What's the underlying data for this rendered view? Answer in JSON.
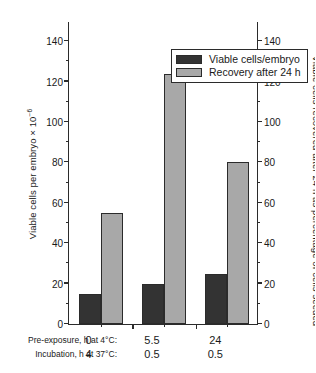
{
  "chart_data": {
    "type": "bar",
    "title": "",
    "categories": [
      "0",
      "5.5",
      "24"
    ],
    "series": [
      {
        "name": "Viable cells/embryo",
        "values": [
          15,
          20,
          25
        ],
        "color": "#333333",
        "axis": "left"
      },
      {
        "name": "Recovery after 24 h",
        "values": [
          55,
          124,
          80
        ],
        "color": "#a8a8a8",
        "axis": "right"
      }
    ],
    "ylabel": "Viable cells per embryo × 10",
    "ylabel_exponent": "−6",
    "y2label": "Viable cells recovered after 24 h as percentage of cells seeded",
    "xlabel": "",
    "ylim": [
      0,
      150
    ],
    "y2lim": [
      0,
      150
    ],
    "yticks": [
      0,
      20,
      40,
      60,
      80,
      100,
      120,
      140
    ],
    "y2ticks": [
      0,
      20,
      40,
      60,
      80,
      100,
      120,
      140
    ],
    "ytick_labels": [
      "0",
      "20",
      "40",
      "60",
      "80",
      "100",
      "120",
      "140"
    ],
    "y2tick_labels": [
      "0",
      "20",
      "40",
      "60",
      "80",
      "100",
      "120",
      "140"
    ],
    "yminor_ticks": [
      10,
      30,
      50,
      70,
      90,
      110,
      130
    ],
    "grid": false,
    "legend_position": "upper center",
    "group_label_rows": [
      {
        "title": "Pre-exposure, h at 4°C:",
        "values": [
          "0",
          "5.5",
          "24"
        ]
      },
      {
        "title": "Incubation, h at 37°C:",
        "values": [
          "4",
          "0.5",
          "0.5"
        ]
      }
    ]
  },
  "legend": {
    "items": [
      {
        "label": "Viable cells/embryo",
        "color": "#333333"
      },
      {
        "label": "Recovery after 24 h",
        "color": "#a8a8a8"
      }
    ]
  },
  "axes": {
    "left_title_main": "Viable cells per embryo × 10",
    "left_title_sup": "−6",
    "right_title": "Viable cells recovered after 24 h as percentage of cells seeded"
  },
  "colors": {
    "dark_bar": "#333333",
    "light_bar": "#a8a8a8",
    "axis": "#2b2b2b",
    "background": "#ffffff"
  }
}
